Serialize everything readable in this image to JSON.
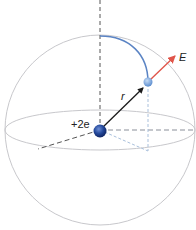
{
  "diagram": {
    "labels": {
      "charge": "+2e",
      "radius": "r",
      "field": "E"
    },
    "colors": {
      "sphere_outline": "#c8c8cc",
      "axis_dashed": "#555555",
      "projection_dashed": "#a9c0dc",
      "arc": "#5b84c4",
      "radius_vector": "#1a1a1a",
      "field_vector": "#e0554a",
      "central_charge": "#1f3f8f",
      "test_point": "#7ea6dc"
    }
  }
}
